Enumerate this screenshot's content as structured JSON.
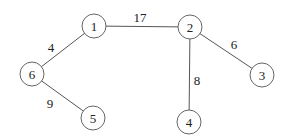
{
  "graph": {
    "type": "weighted-undirected-tree",
    "nodes": [
      {
        "id": "1",
        "label": "1",
        "x": 94,
        "y": 26
      },
      {
        "id": "2",
        "label": "2",
        "x": 190,
        "y": 27
      },
      {
        "id": "3",
        "label": "3",
        "x": 262,
        "y": 75
      },
      {
        "id": "4",
        "label": "4",
        "x": 189,
        "y": 122
      },
      {
        "id": "5",
        "label": "5",
        "x": 93,
        "y": 118
      },
      {
        "id": "6",
        "label": "6",
        "x": 32,
        "y": 74
      }
    ],
    "edges": [
      {
        "from": "1",
        "to": "2",
        "weight": "17",
        "label_x": 140,
        "label_y": 17
      },
      {
        "from": "1",
        "to": "6",
        "weight": "4",
        "label_x": 51,
        "label_y": 47
      },
      {
        "from": "2",
        "to": "3",
        "weight": "6",
        "label_x": 234,
        "label_y": 44
      },
      {
        "from": "2",
        "to": "4",
        "weight": "8",
        "label_x": 197,
        "label_y": 80
      },
      {
        "from": "6",
        "to": "5",
        "weight": "9",
        "label_x": 50,
        "label_y": 103
      }
    ],
    "node_radius": 12
  }
}
